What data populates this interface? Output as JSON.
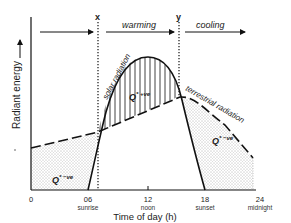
{
  "diagram": {
    "panel_label": "(b)",
    "y_axis_label": "Radiant energy",
    "x_axis_label": "Time of day (h)",
    "x_ticks": [
      {
        "value": "0",
        "sub": ""
      },
      {
        "value": "06",
        "sub": "sunrise"
      },
      {
        "value": "12",
        "sub": "noon"
      },
      {
        "value": "18",
        "sub": "sunset"
      },
      {
        "value": "24",
        "sub": "midnight"
      }
    ],
    "markers": {
      "x": "x",
      "y": "y"
    },
    "phases": {
      "warming": "warming",
      "cooling": "cooling"
    },
    "curves": {
      "solar": "solar radiation",
      "terrestrial": "terrestrial radiation"
    },
    "regions": {
      "positive": "Q*+ve",
      "positive_base": "Q",
      "positive_sup": "* +ve",
      "negative_base": "Q",
      "negative_sup": "* −ve"
    },
    "colors": {
      "line": "#111111",
      "stipple": "#555555",
      "background": "#ffffff"
    }
  }
}
